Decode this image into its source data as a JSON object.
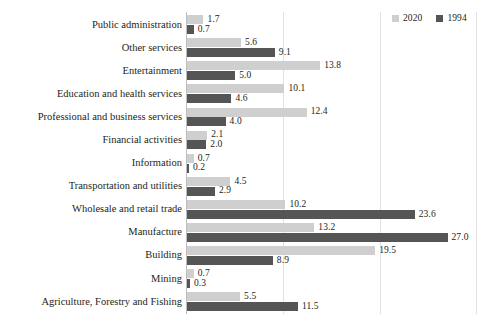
{
  "chart_data": {
    "type": "bar",
    "orientation": "horizontal",
    "title": "",
    "subtitle": "",
    "xlabel": "",
    "ylabel": "",
    "xlim": [
      0,
      31.3
    ],
    "grid": true,
    "gridlines": [
      10,
      20,
      30
    ],
    "legend_position": "top-right",
    "categories": [
      "Public administration",
      "Other services",
      "Entertainment",
      "Education and health services",
      "Professional and business services",
      "Financial activities",
      "Information",
      "Transportation and utilities",
      "Wholesale and retail trade",
      "Manufacture",
      "Building",
      "Mining",
      "Agriculture, Forestry and Fishing"
    ],
    "series": [
      {
        "name": "2020",
        "color": "#cfcfcf",
        "values": [
          1.7,
          5.6,
          13.8,
          10.1,
          12.4,
          2.1,
          0.7,
          4.5,
          10.2,
          13.2,
          19.5,
          0.7,
          5.5
        ],
        "labels": [
          "1.7",
          "5.6",
          "13.8",
          "10.1",
          "12.4",
          "2.1",
          "0.7",
          "4.5",
          "10.2",
          "13.2",
          "19.5",
          "0.7",
          "5.5"
        ]
      },
      {
        "name": "1994",
        "color": "#555555",
        "values": [
          0.7,
          9.1,
          5.0,
          4.6,
          4.0,
          2.0,
          0.2,
          2.9,
          23.6,
          27.0,
          8.9,
          0.3,
          11.5
        ],
        "labels": [
          "0.7",
          "9.1",
          "5.0",
          "4.6",
          "4.0",
          "2.0",
          "0.2",
          "2.9",
          "23.6",
          "27.0",
          "8.9",
          "0.3",
          "11.5"
        ]
      }
    ]
  },
  "legend": {
    "entries": [
      {
        "label": "2020",
        "color": "#cfcfcf"
      },
      {
        "label": "1994",
        "color": "#555555"
      }
    ]
  }
}
